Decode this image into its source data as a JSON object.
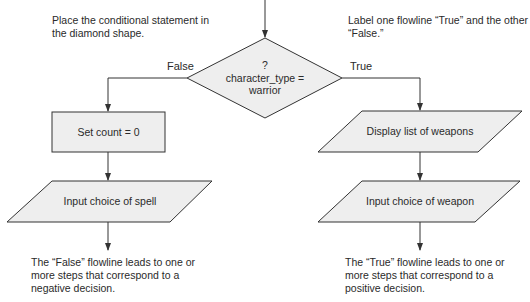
{
  "annotations": {
    "top_left": "Place the conditional statement in the diamond shape.",
    "top_right": "Label one flowline “True” and the other “False.”",
    "bottom_left": "The “False” flowline leads to one or more steps that correspond to a negative decision.",
    "bottom_right": "The “True” flowline leads to one or more steps that correspond to a positive decision."
  },
  "decision": {
    "line1": "?",
    "line2": "character_type =",
    "line3": "warrior"
  },
  "branches": {
    "false_label": "False",
    "true_label": "True"
  },
  "false_branch": {
    "process": "Set count = 0",
    "input": "Input choice of spell"
  },
  "true_branch": {
    "display": "Display list of weapons",
    "input": "Input choice of weapon"
  },
  "colors": {
    "shape_fill": "#eeeeee",
    "line": "#333333"
  }
}
